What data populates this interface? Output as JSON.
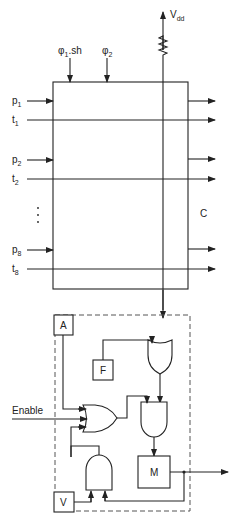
{
  "diagram": {
    "supply": {
      "label": "V",
      "subscript": "dd"
    },
    "clocks": [
      {
        "label": "φ",
        "subscript": "1",
        "suffix": ".sh"
      },
      {
        "label": "φ",
        "subscript": "2",
        "suffix": ""
      }
    ],
    "inputs": [
      {
        "label": "p",
        "subscript": "1"
      },
      {
        "label": "t",
        "subscript": "1"
      },
      {
        "label": "p",
        "subscript": "2"
      },
      {
        "label": "t",
        "subscript": "2"
      },
      {
        "label": "p",
        "subscript": "8"
      },
      {
        "label": "t",
        "subscript": "8"
      }
    ],
    "ellipsis": "⋮",
    "array_label": "C",
    "control_blocks": {
      "a": "A",
      "f": "F",
      "m": "M",
      "v": "V"
    },
    "enable_label": "Enable",
    "gates": [
      "or-gate-top",
      "or-gate-enable",
      "and-gate-middle",
      "and-gate-bottom"
    ]
  }
}
